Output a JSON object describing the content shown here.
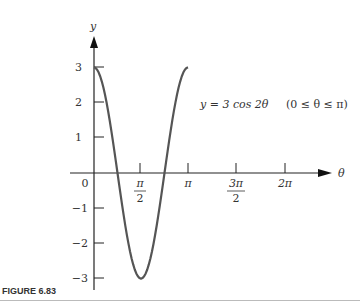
{
  "figure": {
    "caption": "FIGURE 6.83",
    "equation": "y = 3 cos 2θ",
    "domain_note": "(0 ≤ θ ≤ π)",
    "curve_color": "#555555",
    "axis_color": "#222222"
  },
  "chart_data": {
    "type": "line",
    "title": "",
    "xlabel": "θ",
    "ylabel": "y",
    "function": "y = 3 cos 2θ",
    "domain": "0 ≤ θ ≤ π",
    "x_ticks": [
      "0",
      "π/2",
      "π",
      "3π/2",
      "2π"
    ],
    "y_ticks": [
      "3",
      "2",
      "1",
      "-1",
      "-2",
      "-3"
    ],
    "xlim": [
      0,
      6.2832
    ],
    "ylim": [
      -3,
      3
    ],
    "grid": false,
    "legend": "none",
    "series": [
      {
        "name": "y = 3 cos 2θ",
        "x": [
          0,
          0.3927,
          0.7854,
          1.1781,
          1.5708,
          1.9635,
          2.3562,
          2.7489,
          3.1416
        ],
        "values": [
          3,
          2.121,
          0,
          -2.121,
          -3,
          -2.121,
          0,
          2.121,
          3
        ]
      }
    ],
    "annotations": [
      "y = 3 cos 2θ",
      "(0 ≤ θ ≤ π)"
    ]
  },
  "axis": {
    "x_label": "θ",
    "y_label": "y",
    "origin_label": "0",
    "x_ticks": [
      {
        "num": "π",
        "den": "2"
      },
      {
        "num": "π",
        "den": ""
      },
      {
        "num": "3π",
        "den": "2"
      },
      {
        "num": "2π",
        "den": ""
      }
    ],
    "y_ticks": [
      "3",
      "2",
      "1",
      "−1",
      "−2",
      "−3"
    ]
  }
}
